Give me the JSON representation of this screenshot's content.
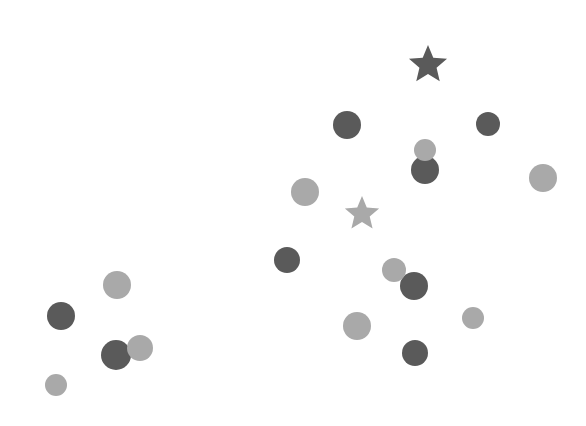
{
  "colors": {
    "dark": "#5a5a5a",
    "light": "#a9a9a9",
    "background": "#ffffff"
  },
  "chart_data": {
    "type": "scatter",
    "title": "",
    "xlabel": "",
    "ylabel": "",
    "grid": false,
    "legend": null,
    "axes_visible": false,
    "xlim": [
      0,
      586
    ],
    "ylim": [
      0,
      426
    ],
    "series": [
      {
        "name": "dark",
        "marker": "circle",
        "points": [
          {
            "x": 347,
            "y": 125,
            "r": 14
          },
          {
            "x": 488,
            "y": 124,
            "r": 12
          },
          {
            "x": 425,
            "y": 170,
            "r": 14
          },
          {
            "x": 287,
            "y": 260,
            "r": 13
          },
          {
            "x": 414,
            "y": 286,
            "r": 14
          },
          {
            "x": 61,
            "y": 316,
            "r": 14
          },
          {
            "x": 116,
            "y": 355,
            "r": 15
          },
          {
            "x": 415,
            "y": 353,
            "r": 13
          }
        ]
      },
      {
        "name": "light",
        "marker": "circle",
        "points": [
          {
            "x": 425,
            "y": 150,
            "r": 11
          },
          {
            "x": 543,
            "y": 178,
            "r": 14
          },
          {
            "x": 305,
            "y": 192,
            "r": 14
          },
          {
            "x": 394,
            "y": 270,
            "r": 12
          },
          {
            "x": 117,
            "y": 285,
            "r": 14
          },
          {
            "x": 357,
            "y": 326,
            "r": 14
          },
          {
            "x": 473,
            "y": 318,
            "r": 11
          },
          {
            "x": 140,
            "y": 348,
            "r": 13
          },
          {
            "x": 56,
            "y": 385,
            "r": 11
          }
        ]
      },
      {
        "name": "centroids",
        "marker": "star",
        "points": [
          {
            "x": 428,
            "y": 65,
            "r": 20,
            "color": "dark"
          },
          {
            "x": 362,
            "y": 214,
            "r": 18,
            "color": "light"
          }
        ]
      }
    ]
  }
}
